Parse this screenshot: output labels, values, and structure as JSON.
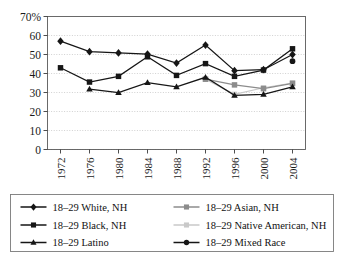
{
  "chart_data": {
    "type": "line",
    "title": "",
    "subtitle": "",
    "xlabel": "",
    "ylabel": "",
    "x": [
      1972,
      1976,
      1980,
      1984,
      1988,
      1992,
      1996,
      2000,
      2004
    ],
    "categories": [
      "1972",
      "1976",
      "1980",
      "1984",
      "1988",
      "1992",
      "1996",
      "2000",
      "2004"
    ],
    "xtick_labels": [
      "1972",
      "1976",
      "1980",
      "1984",
      "1988",
      "1992",
      "1996",
      "2000",
      "2004"
    ],
    "ytick_labels": [
      "0",
      "10",
      "20",
      "30",
      "40",
      "50",
      "60",
      "70%"
    ],
    "ytick_values": [
      0,
      10,
      20,
      30,
      40,
      50,
      60,
      70
    ],
    "ylim": [
      0,
      70
    ],
    "xlim": [
      1970,
      2006
    ],
    "grid": true,
    "grid_axis": "y",
    "legend_position": "bottom",
    "legend_columns": 2,
    "series": [
      {
        "name": "18–29 White, NH",
        "marker": "diamond",
        "color": "#161616",
        "values": [
          57,
          51.5,
          50.8,
          50.2,
          45.5,
          55,
          41.5,
          42,
          50
        ]
      },
      {
        "name": "18–29 Black, NH",
        "marker": "square",
        "color": "#161616",
        "values": [
          43,
          35.5,
          38.5,
          48.8,
          39,
          45.2,
          38.5,
          41.8,
          53
        ]
      },
      {
        "name": "18–29 Latino",
        "marker": "triangle",
        "color": "#161616",
        "values": [
          null,
          31.8,
          30,
          35.2,
          33,
          38,
          28.5,
          29,
          33
        ]
      },
      {
        "name": "18–29 Asian, NH",
        "marker": "square",
        "color": "#8c8c8c",
        "values": [
          null,
          null,
          null,
          null,
          null,
          37,
          34,
          32,
          34.8
        ]
      },
      {
        "name": "18–29 Native American, NH",
        "marker": "square",
        "color": "#c9c9c9",
        "values": [
          null,
          null,
          null,
          null,
          null,
          37,
          29,
          32.5,
          35
        ]
      },
      {
        "name": "18–29 Mixed Race",
        "marker": "circle",
        "color": "#161616",
        "values": [
          null,
          null,
          null,
          null,
          null,
          null,
          null,
          null,
          46.5
        ]
      }
    ]
  },
  "legend": {
    "entries": [
      {
        "label": "18–29 White, NH"
      },
      {
        "label": "18–29 Asian, NH"
      },
      {
        "label": "18–29 Black, NH"
      },
      {
        "label": "18–29 Native American, NH"
      },
      {
        "label": "18–29 Latino"
      },
      {
        "label": "18–29 Mixed Race"
      }
    ]
  },
  "axis": {
    "y_top_label": "70%",
    "y_labels": [
      "70%",
      "60",
      "50",
      "40",
      "30",
      "20",
      "10",
      "0"
    ],
    "x_labels": [
      "1972",
      "1976",
      "1980",
      "1984",
      "1988",
      "1992",
      "1996",
      "2000",
      "2004"
    ]
  },
  "colors": {
    "series_dark": "#161616",
    "series_gray": "#8c8c8c",
    "series_lightgray": "#c9c9c9",
    "grid": "#bdbdbd",
    "frame": "#5a5a5a",
    "background": "#ffffff"
  }
}
